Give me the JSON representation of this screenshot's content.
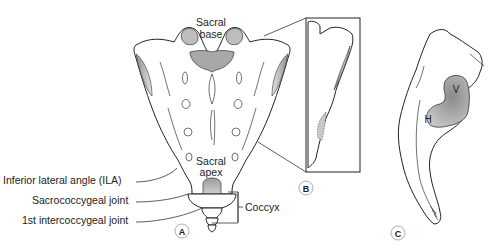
{
  "figure": {
    "panels": [
      {
        "id": "A",
        "label": "A"
      },
      {
        "id": "B",
        "label": "B"
      },
      {
        "id": "C",
        "label": "C"
      }
    ],
    "labels": {
      "sacral_base": [
        "Sacral",
        "base"
      ],
      "sacral_apex": [
        "Sacral",
        "apex"
      ],
      "ila": "Inferior lateral angle (ILA)",
      "sacrococcygeal": "Sacrococcygeal joint",
      "intercoccygeal": "1st intercoccygeal joint",
      "coccyx": "Coccyx",
      "vertical_arm": "V",
      "horizontal_arm": "H"
    },
    "colors": {
      "line": "#222222",
      "shade_dark": "#8a8a8a",
      "shade_light": "#d8d8d8",
      "background": "#ffffff"
    }
  }
}
